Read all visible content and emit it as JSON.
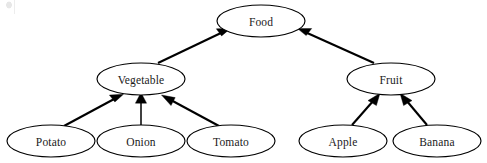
{
  "diagram": {
    "type": "hierarchy-tree",
    "title": "",
    "edge_style": "solid-arrow",
    "edge_direction": "child-to-parent",
    "relation_label": "is-a",
    "node_shape": "ellipse",
    "colors": {
      "node_fill": "#ffffff",
      "node_stroke": "#000000",
      "edge_stroke": "#000000",
      "label_text": "#1a1a1a",
      "background": "#ffffff"
    },
    "levels": [
      {
        "index": 0,
        "nodes": [
          "food"
        ]
      },
      {
        "index": 1,
        "nodes": [
          "vegetable",
          "fruit"
        ]
      },
      {
        "index": 2,
        "nodes": [
          "potato",
          "onion",
          "tomato",
          "apple",
          "banana"
        ]
      }
    ],
    "nodes": [
      {
        "id": "food",
        "label": "Food",
        "cx": 261,
        "cy": 21,
        "rx": 44,
        "ry": 16
      },
      {
        "id": "vegetable",
        "label": "Vegetable",
        "cx": 141,
        "cy": 79,
        "rx": 44,
        "ry": 16
      },
      {
        "id": "fruit",
        "label": "Fruit",
        "cx": 391,
        "cy": 79,
        "rx": 44,
        "ry": 16
      },
      {
        "id": "potato",
        "label": "Potato",
        "cx": 51,
        "cy": 141,
        "rx": 44,
        "ry": 16
      },
      {
        "id": "onion",
        "label": "Onion",
        "cx": 141,
        "cy": 141,
        "rx": 44,
        "ry": 16
      },
      {
        "id": "tomato",
        "label": "Tomato",
        "cx": 231,
        "cy": 141,
        "rx": 44,
        "ry": 16
      },
      {
        "id": "apple",
        "label": "Apple",
        "cx": 343,
        "cy": 141,
        "rx": 44,
        "ry": 16
      },
      {
        "id": "banana",
        "label": "Banana",
        "cx": 437,
        "cy": 141,
        "rx": 44,
        "ry": 16
      }
    ],
    "edges": [
      {
        "id": "vegetable-food",
        "from": "vegetable",
        "to": "food",
        "from_label": "Vegetable",
        "to_label": "Food"
      },
      {
        "id": "fruit-food",
        "from": "fruit",
        "to": "food",
        "from_label": "Fruit",
        "to_label": "Food"
      },
      {
        "id": "potato-vegetable",
        "from": "potato",
        "to": "vegetable",
        "from_label": "Potato",
        "to_label": "Vegetable"
      },
      {
        "id": "onion-vegetable",
        "from": "onion",
        "to": "vegetable",
        "from_label": "Onion",
        "to_label": "Vegetable"
      },
      {
        "id": "tomato-vegetable",
        "from": "tomato",
        "to": "vegetable",
        "from_label": "Tomato",
        "to_label": "Vegetable"
      },
      {
        "id": "apple-fruit",
        "from": "apple",
        "to": "fruit",
        "from_label": "Apple",
        "to_label": "Fruit"
      },
      {
        "id": "banana-fruit",
        "from": "banana",
        "to": "fruit",
        "from_label": "Banana",
        "to_label": "Fruit"
      }
    ]
  }
}
